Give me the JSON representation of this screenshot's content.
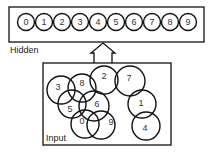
{
  "colors": {
    "stroke": "#111111",
    "background": "#ffffff",
    "text": "#222222"
  },
  "hidden_layer": {
    "label": "Hidden",
    "box": {
      "x": 9,
      "y": 7,
      "w": 195,
      "h": 35
    },
    "units": [
      {
        "label": "0",
        "cx": 26,
        "cy": 22
      },
      {
        "label": "1",
        "cx": 44,
        "cy": 22
      },
      {
        "label": "2",
        "cx": 62,
        "cy": 22
      },
      {
        "label": "3",
        "cx": 80,
        "cy": 22
      },
      {
        "label": "4",
        "cx": 98,
        "cy": 22
      },
      {
        "label": "5",
        "cx": 116,
        "cy": 22
      },
      {
        "label": "6",
        "cx": 134,
        "cy": 22
      },
      {
        "label": "7",
        "cx": 152,
        "cy": 22
      },
      {
        "label": "8",
        "cx": 170,
        "cy": 22
      },
      {
        "label": "9",
        "cx": 188,
        "cy": 22
      }
    ],
    "unit_radius": 8.5
  },
  "arrow": {
    "label": "projection-arrow",
    "direction": "up"
  },
  "input_layer": {
    "label": "Input",
    "box": {
      "x": 43,
      "y": 63,
      "w": 128,
      "h": 82
    },
    "fields": [
      {
        "label": "3",
        "cx": 61,
        "cy": 90,
        "r": 14,
        "tx": 58,
        "ty": 87
      },
      {
        "label": "8",
        "cx": 82,
        "cy": 88,
        "r": 14,
        "tx": 82,
        "ty": 83
      },
      {
        "label": "5",
        "cx": 72,
        "cy": 104,
        "r": 14,
        "tx": 70,
        "ty": 109
      },
      {
        "label": "2",
        "cx": 104,
        "cy": 80,
        "r": 14,
        "tx": 104,
        "ty": 76
      },
      {
        "label": "6",
        "cx": 94,
        "cy": 106,
        "r": 15,
        "tx": 97,
        "ty": 104
      },
      {
        "label": "0",
        "cx": 85,
        "cy": 124,
        "r": 14,
        "tx": 82,
        "ty": 121
      },
      {
        "label": "9",
        "cx": 101,
        "cy": 125,
        "r": 14,
        "tx": 111,
        "ty": 122
      },
      {
        "label": "7",
        "cx": 130,
        "cy": 81,
        "r": 15,
        "tx": 129,
        "ty": 78
      },
      {
        "label": "1",
        "cx": 142,
        "cy": 104,
        "r": 14,
        "tx": 141,
        "ty": 103
      },
      {
        "label": "4",
        "cx": 146,
        "cy": 126,
        "r": 14,
        "tx": 145,
        "ty": 128
      }
    ]
  }
}
